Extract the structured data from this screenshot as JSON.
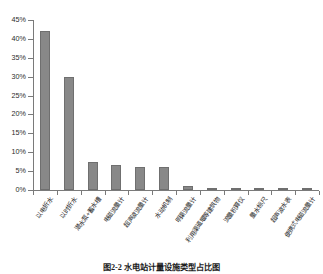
{
  "figure": {
    "caption": "图2-2  水电站计量设施类型占比图",
    "bar_color": "#888888",
    "axis_color": "#7a7a7a",
    "text_color": "#242424"
  },
  "chart_data": {
    "type": "bar",
    "title": "",
    "xlabel": "",
    "ylabel": "",
    "ylim": [
      0,
      45
    ],
    "ytick_labels": [
      "0%",
      "5%",
      "10%",
      "15%",
      "20%",
      "25%",
      "30%",
      "35%",
      "40%",
      "45%"
    ],
    "ytick_values": [
      0,
      5,
      10,
      15,
      20,
      25,
      30,
      35,
      40,
      45
    ],
    "grid": false,
    "legend": "none",
    "categories": [
      "以电折水",
      "以时折水",
      "潜水泵+蓄水槽",
      "电磁流量计",
      "超声波流量计",
      "水动机制",
      "明渠流量计",
      "利用渠道堰等建筑物",
      "流量积算仪",
      "量水标尺",
      "超声波水表",
      "便携式电磁流量计"
    ],
    "values": [
      42,
      30,
      7.5,
      6.5,
      6,
      6,
      1,
      0.6,
      0.5,
      0.4,
      0.3,
      0.2
    ]
  }
}
